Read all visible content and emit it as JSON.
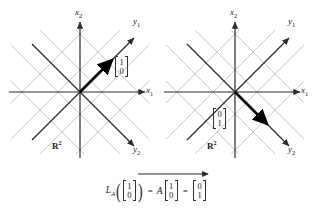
{
  "figure": {
    "caption_equation": "L_A([1,0]) = A[1,0] = [0,1]",
    "colors": {
      "axis": "#2b2b2b",
      "grid": "#c9c9c9",
      "vector": "#000000",
      "text": "#1a1a1a",
      "background": "#ffffff"
    }
  },
  "panels": [
    {
      "id": "domain-panel",
      "space_label": "R",
      "space_superscript": "2",
      "axes": [
        {
          "name": "x-axis-1",
          "label": "x",
          "sub": "1",
          "angle_deg": 0
        },
        {
          "name": "x-axis-2",
          "label": "x",
          "sub": "2",
          "angle_deg": 90
        },
        {
          "name": "y-axis-1",
          "label": "y",
          "sub": "1",
          "angle_deg": 45
        },
        {
          "name": "y-axis-2",
          "label": "y",
          "sub": "2",
          "angle_deg": -45
        }
      ],
      "vector": {
        "name": "input-vector",
        "components": [
          "1",
          "0"
        ],
        "direction_deg": 45,
        "description": "bold arrow along y1 axis"
      }
    },
    {
      "id": "codomain-panel",
      "space_label": "R",
      "space_superscript": "2",
      "axes": [
        {
          "name": "x-axis-1",
          "label": "x",
          "sub": "1",
          "angle_deg": 0
        },
        {
          "name": "x-axis-2",
          "label": "x",
          "sub": "2",
          "angle_deg": 90
        },
        {
          "name": "y-axis-1",
          "label": "y",
          "sub": "1",
          "angle_deg": 45
        },
        {
          "name": "y-axis-2",
          "label": "y",
          "sub": "2",
          "angle_deg": -45
        }
      ],
      "vector": {
        "name": "output-vector",
        "components": [
          "0",
          "1"
        ],
        "direction_deg": -45,
        "description": "bold arrow along y2 axis"
      }
    }
  ],
  "equation": {
    "operator": "L",
    "operator_subscript": "A",
    "open_paren": "(",
    "close_paren": ")",
    "input_vector": [
      "1",
      "0"
    ],
    "equals_1": "=",
    "matrix": "A",
    "matrix_vector": [
      "1",
      "0"
    ],
    "equals_2": "=",
    "result_vector": [
      "0",
      "1"
    ]
  },
  "labels": {
    "left_x1": "x",
    "left_x1_sub": "1",
    "left_x2": "x",
    "left_x2_sub": "2",
    "left_y1": "y",
    "left_y1_sub": "1",
    "left_y2": "y",
    "left_y2_sub": "2",
    "left_space": "R",
    "left_space_sup": "2",
    "left_vec_top": "1",
    "left_vec_bottom": "0",
    "right_x1": "x",
    "right_x1_sub": "1",
    "right_x2": "x",
    "right_x2_sub": "2",
    "right_y1": "y",
    "right_y1_sub": "1",
    "right_y2": "y",
    "right_y2_sub": "2",
    "right_space": "R",
    "right_space_sup": "2",
    "right_vec_top": "0",
    "right_vec_bottom": "1"
  }
}
